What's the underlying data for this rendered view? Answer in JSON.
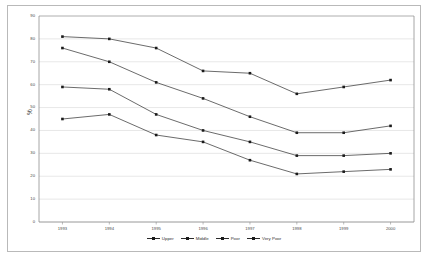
{
  "chart_data": {
    "type": "line",
    "title": "",
    "xlabel": "",
    "ylabel": "%",
    "categories": [
      "1993",
      "1994",
      "1995",
      "1996",
      "1997",
      "1998",
      "1999",
      "2000"
    ],
    "ylim": [
      0,
      90
    ],
    "yticks": [
      0,
      10,
      20,
      30,
      40,
      50,
      60,
      70,
      80,
      90
    ],
    "grid": true,
    "legend_position": "bottom",
    "series": [
      {
        "name": "Upper",
        "values": [
          81,
          80,
          76,
          66,
          65,
          56,
          59,
          62
        ]
      },
      {
        "name": "Middle",
        "values": [
          76,
          70,
          61,
          54,
          46,
          39,
          39,
          42
        ]
      },
      {
        "name": "Poor",
        "values": [
          59,
          58,
          47,
          40,
          35,
          29,
          29,
          30
        ]
      },
      {
        "name": "Very Poor",
        "values": [
          45,
          47,
          38,
          35,
          27,
          21,
          22,
          23
        ]
      }
    ]
  },
  "legend": {
    "items": [
      {
        "label": "Upper"
      },
      {
        "label": "Middle"
      },
      {
        "label": "Poor"
      },
      {
        "label": "Very Poor"
      }
    ]
  }
}
